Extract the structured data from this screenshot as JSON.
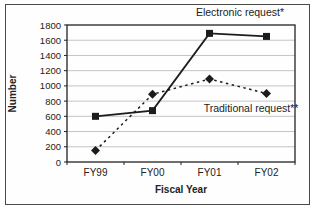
{
  "figure": {
    "background_color": "#ffffff",
    "border_color": "#4a4a4a",
    "plot_border_color": "#222222",
    "gridline_color": "#c4c4c4",
    "text_color": "#222222",
    "series_color": "#1c1c1c"
  },
  "chart_data": {
    "type": "line",
    "categories": [
      "FY99",
      "FY00",
      "FY01",
      "FY02"
    ],
    "series": [
      {
        "name": "Electronic request*",
        "values": [
          600,
          675,
          1690,
          1650
        ],
        "marker": "square",
        "line_style": "solid"
      },
      {
        "name": "Traditional request**",
        "values": [
          150,
          890,
          1090,
          900
        ],
        "marker": "diamond",
        "line_style": "dashed"
      }
    ],
    "title": "",
    "xlabel": "Fiscal Year",
    "ylabel": "Number",
    "ylim": [
      0,
      1800
    ],
    "ytick_step": 200,
    "ytick_labels": [
      "0",
      "200",
      "400",
      "600",
      "800",
      "1000",
      "1200",
      "1400",
      "1600",
      "1800"
    ],
    "grid": "horizontal",
    "legend": "inline-annotations",
    "annotations": [
      {
        "text": "Electronic request*",
        "series_index": 0
      },
      {
        "text": "Traditional request**",
        "series_index": 1
      }
    ]
  }
}
